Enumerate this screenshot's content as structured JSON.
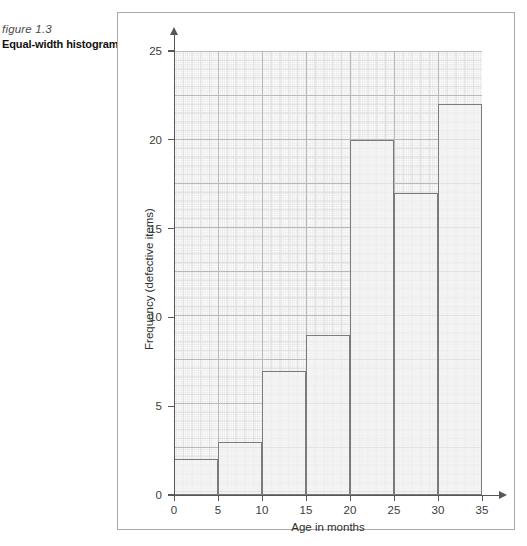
{
  "caption": {
    "figure_number": "figure 1.3",
    "figure_title": "Equal-width histogram"
  },
  "colors": {
    "bar_fill": "#f3f3f3",
    "bar_stroke": "#7b7b7b",
    "axis": "#565656",
    "grid_major": "#b9b9b9",
    "grid_minor": "#eceaea",
    "frame": "#a9a9a9"
  },
  "chart_data": {
    "type": "bar",
    "title": "",
    "xlabel": "Age in months",
    "ylabel": "Frequency (defective items)",
    "categories": [
      "0-5",
      "5-10",
      "10-15",
      "15-20",
      "20-25",
      "25-30",
      "30-35"
    ],
    "bin_edges": [
      0,
      5,
      10,
      15,
      20,
      25,
      30,
      35
    ],
    "values": [
      2,
      3,
      7,
      9,
      20,
      17,
      22
    ],
    "bin_width": 5,
    "xlim": [
      0,
      35
    ],
    "ylim": [
      0,
      25
    ],
    "xticks": [
      0,
      5,
      10,
      15,
      20,
      25,
      30,
      35
    ],
    "yticks": [
      0,
      5,
      10,
      15,
      20,
      25
    ],
    "xtick_labels": [
      "0",
      "5",
      "10",
      "15",
      "20",
      "25",
      "30",
      "35"
    ],
    "ytick_labels": [
      "0",
      "5",
      "10",
      "15",
      "20",
      "25"
    ],
    "grid": true,
    "grid_style": "graph-paper",
    "legend": null,
    "legend_position": "none"
  }
}
